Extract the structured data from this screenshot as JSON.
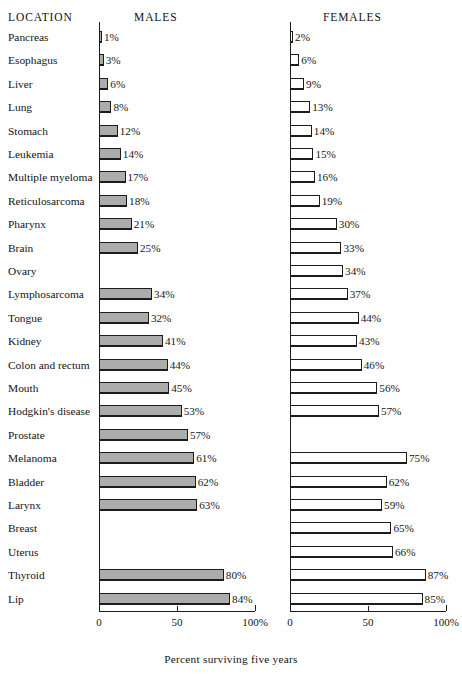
{
  "headers": {
    "location": "LOCATION",
    "males": "MALES",
    "females": "FEMALES"
  },
  "axis": {
    "caption": "Percent surviving five years",
    "ticks": [
      "0",
      "50",
      "100%"
    ]
  },
  "colors": {
    "male_bar_fill": "#acacac",
    "female_bar_fill": "#ffffff",
    "outline": "#1c1c1c",
    "background": "#ffffff",
    "text": "#141414"
  },
  "chart_data": {
    "type": "bar",
    "title": "",
    "subtitle": "",
    "xlabel": "Percent surviving five years",
    "ylabel": "LOCATION",
    "orientation": "horizontal",
    "grid": false,
    "legend_position": "column-headers",
    "xlim": [
      0,
      100
    ],
    "xticks": [
      0,
      50,
      100
    ],
    "xtick_labels": [
      "0",
      "50",
      "100%"
    ],
    "panels": [
      "MALES",
      "FEMALES"
    ],
    "categories": [
      "Pancreas",
      "Esophagus",
      "Liver",
      "Lung",
      "Stomach",
      "Leukemia",
      "Multiple myeloma",
      "Reticulosarcoma",
      "Pharynx",
      "Brain",
      "Ovary",
      "Lymphosarcoma",
      "Tongue",
      "Kidney",
      "Colon and rectum",
      "Mouth",
      "Hodgkin's disease",
      "Prostate",
      "Melanoma",
      "Bladder",
      "Larynx",
      "Breast",
      "Uterus",
      "Thyroid",
      "Lip"
    ],
    "series": [
      {
        "name": "MALES",
        "values": [
          1,
          3,
          6,
          8,
          12,
          14,
          17,
          18,
          21,
          25,
          null,
          34,
          32,
          41,
          44,
          45,
          53,
          57,
          61,
          62,
          63,
          null,
          null,
          80,
          84
        ],
        "labels": [
          "1%",
          "3%",
          "6%",
          "8%",
          "12%",
          "14%",
          "17%",
          "18%",
          "21%",
          "25%",
          "",
          "34%",
          "32%",
          "41%",
          "44%",
          "45%",
          "53%",
          "57%",
          "61%",
          "62%",
          "63%",
          "",
          "",
          "80%",
          "84%"
        ]
      },
      {
        "name": "FEMALES",
        "values": [
          2,
          6,
          9,
          13,
          14,
          15,
          16,
          19,
          30,
          33,
          34,
          37,
          44,
          43,
          46,
          56,
          57,
          null,
          75,
          62,
          59,
          65,
          66,
          87,
          85
        ],
        "labels": [
          "2%",
          "6%",
          "9%",
          "13%",
          "14%",
          "15%",
          "16%",
          "19%",
          "30%",
          "33%",
          "34%",
          "37%",
          "44%",
          "43%",
          "46%",
          "56%",
          "57%",
          "",
          "75%",
          "62%",
          "59%",
          "65%",
          "66%",
          "87%",
          "85%"
        ]
      }
    ]
  }
}
